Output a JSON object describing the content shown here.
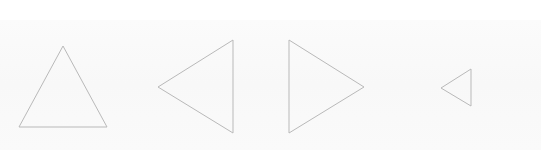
{
  "canvas": {
    "width": 541,
    "height": 166,
    "background": "#ffffff",
    "band_color": "#f9f9f9"
  },
  "stroke": {
    "color": "#b9b9b9",
    "width": 1
  },
  "shapes": [
    {
      "id": "triangle-up",
      "direction": "up",
      "points": "63,46 107,127 19,127"
    },
    {
      "id": "triangle-left",
      "direction": "left",
      "points": "233,40 233,133 158,87"
    },
    {
      "id": "triangle-right",
      "direction": "right",
      "points": "289,40 364,87 289,133"
    },
    {
      "id": "triangle-left-small",
      "direction": "left",
      "points": "471,69 471,106 441,88"
    }
  ]
}
